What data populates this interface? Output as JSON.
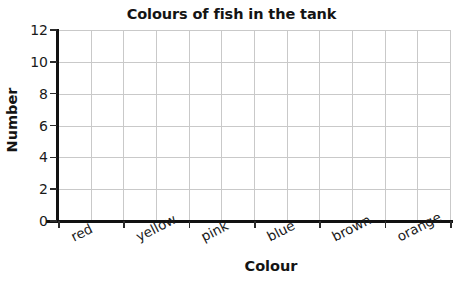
{
  "chart_data": {
    "type": "bar",
    "title": "Colours of fish in the tank",
    "xlabel": "Colour",
    "ylabel": "Number",
    "categories": [
      "red",
      "yellow",
      "pink",
      "blue",
      "brown",
      "orange"
    ],
    "values": [
      null,
      null,
      null,
      null,
      null,
      null
    ],
    "yticks": [
      0,
      2,
      4,
      6,
      8,
      10,
      12
    ],
    "ylim": [
      0,
      12
    ],
    "grid": true,
    "legend": "none",
    "note": "empty blank grid - no bars drawn"
  },
  "axes": {
    "y_tick_labels": [
      "12",
      "10",
      "8",
      "6",
      "4",
      "2",
      "0"
    ],
    "y_title": "Number",
    "x_title": "Colour",
    "x_tick_labels": [
      "red",
      "yellow",
      "pink",
      "blue",
      "brown",
      "orange"
    ]
  },
  "colors": {
    "axis": "#111111",
    "grid": "#c9c9c9",
    "text": "#1a1a1a",
    "background": "#ffffff"
  }
}
